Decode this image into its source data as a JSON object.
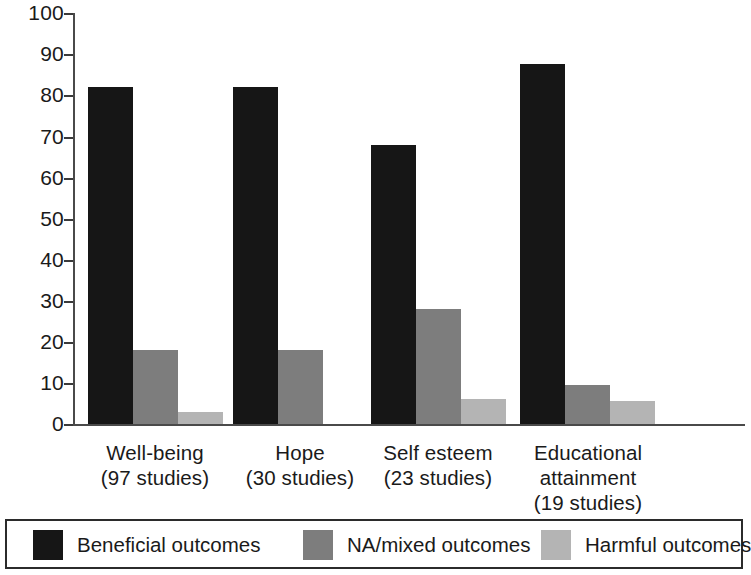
{
  "chart_data": {
    "type": "bar",
    "title": "",
    "subtitle": "",
    "xlabel": "",
    "ylabel": "",
    "ylim": [
      0,
      100
    ],
    "y_ticks": [
      0,
      10,
      20,
      30,
      40,
      50,
      60,
      70,
      80,
      90,
      100
    ],
    "y_tick_labels": [
      "0",
      "10",
      "20",
      "30",
      "40",
      "50",
      "60",
      "70",
      "80",
      "90",
      "100"
    ],
    "grid": false,
    "legend_position": "bottom",
    "categories": [
      "Well-being\n(97 studies)",
      "Hope\n(30 studies)",
      "Self esteem\n(23 studies)",
      "Educational\nattainment\n(19 studies)"
    ],
    "category_lines": [
      [
        "Well-being",
        "(97 studies)"
      ],
      [
        "Hope",
        "(30 studies)"
      ],
      [
        "Self esteem",
        "(23 studies)"
      ],
      [
        "Educational",
        "attainment",
        "(19 studies)"
      ]
    ],
    "series": [
      {
        "name": "Beneficial outcomes",
        "color": "#161616",
        "values": [
          82,
          82,
          68,
          87.5
        ]
      },
      {
        "name": "NA/mixed outcomes",
        "color": "#7d7d7d",
        "values": [
          18,
          18,
          28,
          9.5
        ]
      },
      {
        "name": "Harmful outcomes",
        "color": "#b4b4b4",
        "values": [
          3,
          0,
          6,
          5.5
        ]
      }
    ]
  },
  "legend": {
    "items": [
      {
        "label": "Beneficial outcomes",
        "color": "#161616"
      },
      {
        "label": "NA/mixed outcomes",
        "color": "#7d7d7d"
      },
      {
        "label": "Harmful outcomes",
        "color": "#b4b4b4"
      }
    ]
  },
  "axis": {
    "y_labels": [
      "100",
      "90",
      "80",
      "70",
      "60",
      "50",
      "40",
      "30",
      "20",
      "10",
      "0"
    ]
  }
}
